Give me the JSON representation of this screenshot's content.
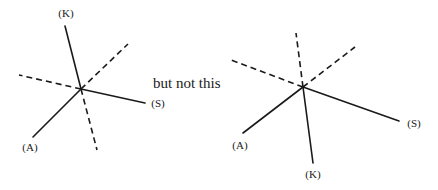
{
  "caption": "but not this",
  "diagrams": [
    {
      "name": "correct-star",
      "center": [
        81,
        89
      ],
      "solid_lines": [
        {
          "label": "(K)",
          "end": [
            65,
            26
          ],
          "label_pos": [
            66,
            17
          ]
        },
        {
          "label": "(S)",
          "end": [
            145,
            103
          ],
          "label_pos": [
            158,
            107
          ]
        },
        {
          "label": "(A)",
          "end": [
            33,
            137
          ],
          "label_pos": [
            30,
            151
          ]
        }
      ],
      "dashed_lines": [
        [
          19,
          75
        ],
        [
          128,
          44
        ],
        [
          97,
          150
        ]
      ]
    },
    {
      "name": "incorrect-star",
      "center": [
        303,
        87
      ],
      "solid_lines": [
        {
          "label": "(A)",
          "end": [
            243,
            133
          ],
          "label_pos": [
            240,
            149
          ]
        },
        {
          "label": "(S)",
          "end": [
            399,
            121
          ],
          "label_pos": [
            414,
            127
          ]
        },
        {
          "label": "(K)",
          "end": [
            313,
            163
          ],
          "label_pos": [
            313,
            178
          ]
        }
      ],
      "dashed_lines": [
        [
          296,
          33
        ],
        [
          231,
          60
        ],
        [
          355,
          47
        ]
      ]
    }
  ]
}
